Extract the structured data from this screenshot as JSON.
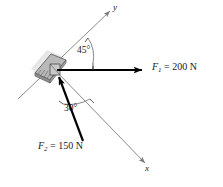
{
  "figure": {
    "kind": "free-body-force-diagram",
    "width": 223,
    "height": 187,
    "background_color": "#ffffff"
  },
  "axes": {
    "y_label": "y",
    "x_label": "x",
    "origin": {
      "x": 55,
      "y": 70
    },
    "y_axis": {
      "from": {
        "x": 18,
        "y": 99
      },
      "to": {
        "x": 112,
        "y": 9
      }
    },
    "x_axis": {
      "from": {
        "x": 55,
        "y": 70
      },
      "to": {
        "x": 147,
        "y": 165
      }
    }
  },
  "support": {
    "name": "fixed-plate-bracket",
    "fill_color": "#b3b3b3",
    "edge_color": "#6e6e6e"
  },
  "forces": [
    {
      "id": "F1",
      "symbol": "F",
      "subscript": "1",
      "equals": "=",
      "magnitude": "200",
      "unit": "N",
      "label": "F1 = 200 N",
      "direction": "horizontal-right",
      "color": "#000000",
      "from": {
        "x": 57,
        "y": 70
      },
      "to": {
        "x": 148,
        "y": 70
      }
    },
    {
      "id": "F2",
      "symbol": "F",
      "subscript": "2",
      "equals": "=",
      "magnitude": "150",
      "unit": "N",
      "label": "F2 = 150 N",
      "direction": "up-left-toward-origin",
      "color": "#000000",
      "from": {
        "x": 83,
        "y": 141
      },
      "to": {
        "x": 57,
        "y": 72
      }
    }
  ],
  "angles": [
    {
      "id": "angle-45",
      "value": "45",
      "unit": "°",
      "label": "45°",
      "between": "y-axis and F1",
      "color": "#1a1a1a"
    },
    {
      "id": "angle-30",
      "value": "30",
      "unit": "°",
      "label": "30°",
      "between": "F2 and x-axis",
      "color": "#1a1a1a"
    }
  ],
  "colors": {
    "ink": "#000000",
    "axis_gray": "#8a8a8a",
    "plate_fill": "#b8b8b8",
    "plate_shadow": "#cfcfcf",
    "text": "#1a1a1a"
  }
}
